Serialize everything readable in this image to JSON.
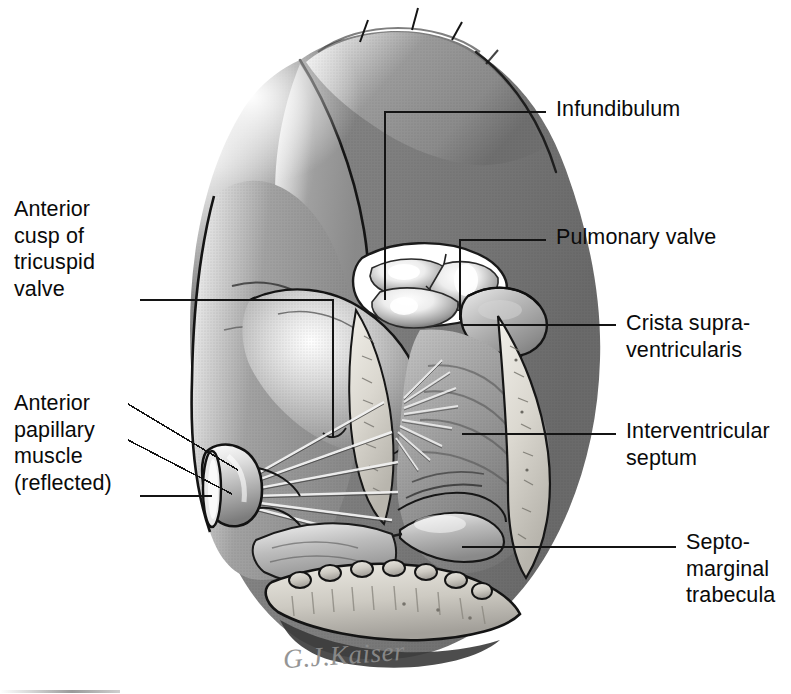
{
  "figure": {
    "kind": "anatomical-illustration",
    "style": "grayscale halftone medical line drawing",
    "signature": "G.J.Kaiser",
    "background_color": "#ffffff",
    "ink_color": "#0a0a0a",
    "leader_color": "#1a1a1a"
  },
  "labels": {
    "anterior_cusp": "Anterior\ncusp of\ntricuspid\nvalve",
    "anterior_papillary": "Anterior\npapillary\nmuscle\n(reflected)",
    "infundibulum": "Infundibulum",
    "pulmonary_valve": "Pulmonary valve",
    "crista": "Crista supra-\nventricularis",
    "interventricular_septum": "Interventricular\nseptum",
    "septomarginal": "Septo-\nmarginal\ntrabecula"
  },
  "structures": [
    {
      "name": "infundibulum",
      "note": "outflow tract above the pulmonary valve"
    },
    {
      "name": "pulmonary-valve",
      "note": "three semilunar cusps with bright highlights"
    },
    {
      "name": "crista-supraventricularis",
      "note": "muscular ridge below outflow tract"
    },
    {
      "name": "interventricular-septum",
      "note": "trabeculated septal wall"
    },
    {
      "name": "septomarginal-trabecula",
      "note": "moderator band crossing the chamber"
    },
    {
      "name": "anterior-cusp-tricuspid-valve",
      "note": "leaflet at left of chamber"
    },
    {
      "name": "anterior-papillary-muscle",
      "note": "cut stump, reflected to the left"
    },
    {
      "name": "chordae-tendineae",
      "note": "fan of thin cords to leaflet margins"
    },
    {
      "name": "cut-myocardium",
      "note": "pale stippled band marking the incision edge"
    },
    {
      "name": "epicardial-surface",
      "note": "mid-gray outer heart wall"
    }
  ],
  "palette": {
    "outer_wall": "#838383",
    "outer_wall_dark": "#6d6d6d",
    "chamber_mid": "#9a9a9a",
    "chamber_light": "#c9c9c9",
    "cut_edge": "#d9d6cf",
    "highlight": "#ffffff",
    "shadow": "#4a4a4a",
    "outline": "#111111"
  }
}
